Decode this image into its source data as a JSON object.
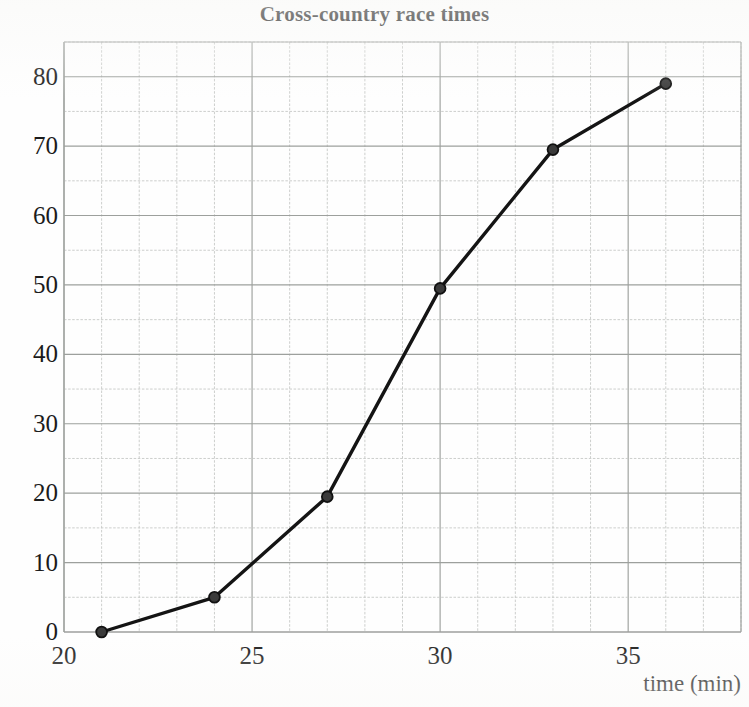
{
  "chart_data": {
    "type": "line",
    "title": "Cross-country race times",
    "xlabel": "time (min)",
    "ylabel": "",
    "xlim": [
      20,
      38
    ],
    "ylim": [
      0,
      85
    ],
    "grid": true,
    "legend": "none",
    "marker": "filled-circle",
    "line_color": "#141414",
    "grid_color": "#b9bcb9",
    "x": [
      21,
      24,
      27,
      30,
      33,
      36
    ],
    "values": [
      0,
      5,
      19.5,
      49.5,
      69.5,
      79
    ],
    "points": [
      {
        "x": 21,
        "y": 0
      },
      {
        "x": 24,
        "y": 5
      },
      {
        "x": 27,
        "y": 19.5
      },
      {
        "x": 30,
        "y": 49.5
      },
      {
        "x": 33,
        "y": 69.5
      },
      {
        "x": 36,
        "y": 79
      }
    ],
    "xticks": [
      20,
      25,
      30,
      35
    ],
    "xtick_labels": [
      "20",
      "25",
      "30",
      "35"
    ],
    "yticks": [
      0,
      10,
      20,
      30,
      40,
      50,
      60,
      70,
      80
    ],
    "ytick_labels": [
      "0",
      "10",
      "20",
      "30",
      "40",
      "50",
      "60",
      "70",
      "80"
    ],
    "x_minor_step": 1,
    "y_minor_step": 5,
    "x_major_step": 5,
    "y_major_step": 10
  },
  "colors": {
    "line": "#141414",
    "marker_fill": "#3a3a3a",
    "marker_edge": "#111111",
    "grid_minor": "#c6c8c6",
    "grid_major": "#9da09d",
    "text": "#1b1b1b",
    "background": "#fefefe"
  }
}
